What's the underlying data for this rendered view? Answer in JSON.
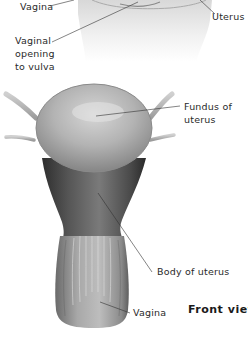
{
  "figure": {
    "type": "anatomical-illustration",
    "view_title": "Front view",
    "top_section_labels": {
      "vagina": "Vagina",
      "uterus": "Uterus",
      "vaginal_opening_line1": "Vaginal",
      "vaginal_opening_line2": "opening",
      "vaginal_opening_line3": "to vulva"
    },
    "front_view_labels": {
      "fundus_line1": "Fundus of",
      "fundus_line2": "uterus",
      "body_of_uterus": "Body of uterus",
      "vagina": "Vagina"
    },
    "colors": {
      "background": "#ffffff",
      "organ_light": "#c9c9c9",
      "organ_mid": "#9a9a9a",
      "organ_dark": "#3c3c3c",
      "leader_line": "#333333",
      "label_text": "#2a2a2a"
    }
  }
}
